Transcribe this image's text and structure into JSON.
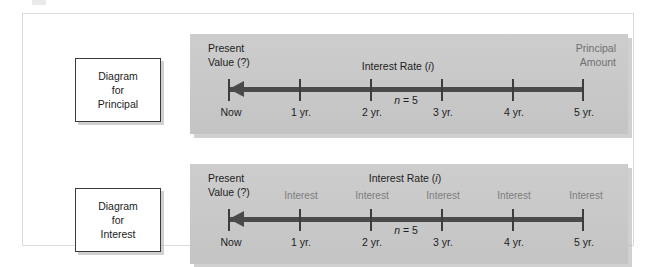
{
  "figure": {
    "panels": [
      {
        "key": "principal",
        "box_label": {
          "line1": "Diagram",
          "line2": "for",
          "line3": "Principal"
        },
        "present_value": {
          "line1": "Present",
          "line2": "Value (?)"
        },
        "rate_label_prefix": "Interest Rate (",
        "rate_label_italic": "i",
        "rate_label_suffix": ")",
        "right_label": {
          "line1": "Principal",
          "line2": "Amount"
        },
        "n_label_italic": "n",
        "n_label_rest": " = 5",
        "tick_labels": [
          "Now",
          "1 yr.",
          "2 yr.",
          "3 yr.",
          "4 yr.",
          "5 yr."
        ],
        "interest_tags": []
      },
      {
        "key": "interest",
        "box_label": {
          "line1": "Diagram",
          "line2": "for",
          "line3": "Interest"
        },
        "present_value": {
          "line1": "Present",
          "line2": "Value (?)"
        },
        "rate_label_prefix": "Interest Rate (",
        "rate_label_italic": "i",
        "rate_label_suffix": ")",
        "right_label": {
          "line1": "",
          "line2": ""
        },
        "n_label_italic": "n",
        "n_label_rest": " = 5",
        "tick_labels": [
          "Now",
          "1 yr.",
          "2 yr.",
          "3 yr.",
          "4 yr.",
          "5 yr."
        ],
        "interest_tags": [
          "Interest",
          "Interest",
          "Interest",
          "Interest",
          "Interest"
        ]
      }
    ],
    "colors": {
      "panel_background": "#c9c9c9",
      "axis": "#4a4a4a",
      "text": "#1d1d1d",
      "muted_text": "#6f6f6f",
      "box_border": "#3a3a3a",
      "frame_border": "#dcdcdc"
    }
  }
}
